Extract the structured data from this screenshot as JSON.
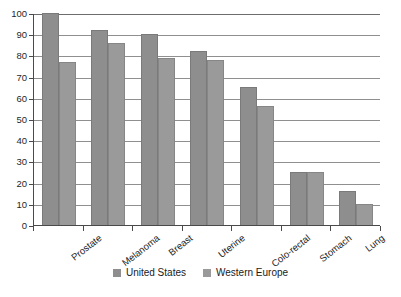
{
  "chart_data": {
    "type": "bar",
    "title": "",
    "subtitle": "",
    "xlabel": "",
    "ylabel": "",
    "ylim": [
      0,
      100
    ],
    "ytick_step": 10,
    "yticks": [
      "100",
      "90",
      "80",
      "70",
      "60",
      "50",
      "40",
      "30",
      "20",
      "10",
      "0"
    ],
    "grid": true,
    "grid_axis": "y",
    "legend_position": "bottom-center",
    "categories": [
      "Prostate",
      "Melanoma",
      "Breast",
      "Uterine",
      "Colo-rectal",
      "Stomach",
      "Lung"
    ],
    "series": [
      {
        "name": "United States",
        "color": "#8e8e8e",
        "values": [
          100,
          92,
          90,
          82,
          65,
          25,
          16
        ]
      },
      {
        "name": "Western Europe",
        "color": "#9a9a9a",
        "values": [
          77,
          86,
          79,
          78,
          56,
          25,
          10
        ]
      }
    ]
  },
  "legend": {
    "items": [
      {
        "label": "United States",
        "swatch": "legend-swatch-us"
      },
      {
        "label": "Western Europe",
        "swatch": "legend-swatch-we"
      }
    ]
  },
  "axes": {
    "y_axis_name": "y-axis",
    "x_axis_name": "x-axis"
  }
}
